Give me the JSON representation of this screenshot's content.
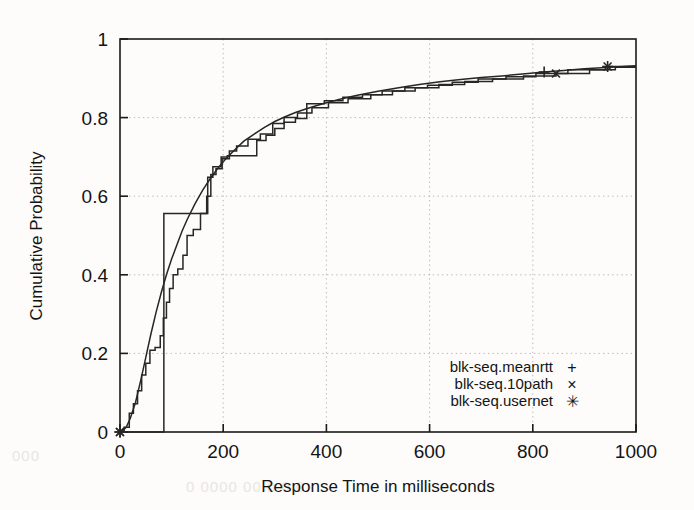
{
  "chart_data": {
    "type": "line",
    "title": "",
    "subtitle": "",
    "xlabel": "Response Time in milliseconds",
    "ylabel": "Cumulative Probability",
    "xlim": [
      0,
      1000
    ],
    "ylim": [
      0,
      1
    ],
    "xticks": [
      "0",
      "200",
      "400",
      "600",
      "800",
      "1000"
    ],
    "xtick_values": [
      0,
      200,
      400,
      600,
      800,
      1000
    ],
    "yticks": [
      "0",
      "0.2",
      "0.4",
      "0.6",
      "0.8",
      "1"
    ],
    "ytick_values": [
      0,
      0.2,
      0.4,
      0.6,
      0.8,
      1
    ],
    "grid": true,
    "grid_style": "dotted",
    "legend_position": "bottom-right",
    "line_color": "#262626",
    "grid_color": "#b9b9b9",
    "axis_color": "#1a1a1a",
    "background": "#fdfcfa",
    "series": [
      {
        "name": "blk-seq.meanrtt",
        "marker": "+",
        "marker_points": [
          [
            0,
            0
          ],
          [
            822,
            0.916
          ]
        ],
        "step": false,
        "points": [
          [
            0,
            0.0
          ],
          [
            5,
            0.003
          ],
          [
            12,
            0.012
          ],
          [
            20,
            0.035
          ],
          [
            30,
            0.075
          ],
          [
            40,
            0.13
          ],
          [
            50,
            0.19
          ],
          [
            60,
            0.25
          ],
          [
            70,
            0.305
          ],
          [
            80,
            0.355
          ],
          [
            90,
            0.4
          ],
          [
            100,
            0.44
          ],
          [
            110,
            0.475
          ],
          [
            120,
            0.51
          ],
          [
            130,
            0.54
          ],
          [
            145,
            0.58
          ],
          [
            160,
            0.615
          ],
          [
            175,
            0.645
          ],
          [
            190,
            0.672
          ],
          [
            205,
            0.695
          ],
          [
            220,
            0.715
          ],
          [
            240,
            0.74
          ],
          [
            260,
            0.758
          ],
          [
            280,
            0.775
          ],
          [
            300,
            0.79
          ],
          [
            320,
            0.802
          ],
          [
            340,
            0.813
          ],
          [
            360,
            0.822
          ],
          [
            380,
            0.83
          ],
          [
            400,
            0.838
          ],
          [
            430,
            0.848
          ],
          [
            460,
            0.857
          ],
          [
            500,
            0.867
          ],
          [
            540,
            0.876
          ],
          [
            580,
            0.884
          ],
          [
            620,
            0.891
          ],
          [
            660,
            0.897
          ],
          [
            700,
            0.902
          ],
          [
            740,
            0.906
          ],
          [
            780,
            0.911
          ],
          [
            822,
            0.916
          ],
          [
            860,
            0.92
          ],
          [
            900,
            0.924
          ],
          [
            950,
            0.928
          ],
          [
            1000,
            0.932
          ]
        ]
      },
      {
        "name": "blk-seq.10path",
        "marker": "×",
        "marker_points": [
          [
            0,
            0
          ],
          [
            845,
            0.912
          ]
        ],
        "step": true,
        "points": [
          [
            0,
            0.0
          ],
          [
            8,
            0.0
          ],
          [
            8,
            0.012
          ],
          [
            18,
            0.012
          ],
          [
            18,
            0.048
          ],
          [
            26,
            0.048
          ],
          [
            26,
            0.072
          ],
          [
            34,
            0.072
          ],
          [
            34,
            0.105
          ],
          [
            42,
            0.105
          ],
          [
            42,
            0.145
          ],
          [
            50,
            0.145
          ],
          [
            50,
            0.175
          ],
          [
            58,
            0.175
          ],
          [
            58,
            0.208
          ],
          [
            68,
            0.208
          ],
          [
            68,
            0.215
          ],
          [
            78,
            0.215
          ],
          [
            78,
            0.245
          ],
          [
            84,
            0.245
          ],
          [
            84,
            0.29
          ],
          [
            90,
            0.29
          ],
          [
            90,
            0.33
          ],
          [
            96,
            0.33
          ],
          [
            96,
            0.365
          ],
          [
            103,
            0.365
          ],
          [
            103,
            0.4
          ],
          [
            112,
            0.4
          ],
          [
            112,
            0.415
          ],
          [
            122,
            0.415
          ],
          [
            122,
            0.45
          ],
          [
            130,
            0.45
          ],
          [
            130,
            0.5
          ],
          [
            142,
            0.5
          ],
          [
            142,
            0.515
          ],
          [
            156,
            0.515
          ],
          [
            156,
            0.556
          ],
          [
            168,
            0.556
          ],
          [
            168,
            0.6
          ],
          [
            176,
            0.6
          ],
          [
            176,
            0.655
          ],
          [
            186,
            0.655
          ],
          [
            186,
            0.67
          ],
          [
            198,
            0.67
          ],
          [
            198,
            0.695
          ],
          [
            212,
            0.695
          ],
          [
            212,
            0.715
          ],
          [
            226,
            0.715
          ],
          [
            226,
            0.728
          ],
          [
            248,
            0.728
          ],
          [
            248,
            0.745
          ],
          [
            272,
            0.745
          ],
          [
            272,
            0.758
          ],
          [
            296,
            0.758
          ],
          [
            296,
            0.785
          ],
          [
            318,
            0.785
          ],
          [
            318,
            0.8
          ],
          [
            344,
            0.8
          ],
          [
            344,
            0.812
          ],
          [
            372,
            0.812
          ],
          [
            372,
            0.825
          ],
          [
            404,
            0.825
          ],
          [
            404,
            0.838
          ],
          [
            442,
            0.838
          ],
          [
            442,
            0.848
          ],
          [
            486,
            0.848
          ],
          [
            486,
            0.858
          ],
          [
            528,
            0.858
          ],
          [
            528,
            0.868
          ],
          [
            572,
            0.868
          ],
          [
            572,
            0.876
          ],
          [
            618,
            0.876
          ],
          [
            618,
            0.884
          ],
          [
            668,
            0.884
          ],
          [
            668,
            0.892
          ],
          [
            722,
            0.892
          ],
          [
            722,
            0.898
          ],
          [
            782,
            0.898
          ],
          [
            782,
            0.906
          ],
          [
            845,
            0.906
          ],
          [
            845,
            0.912
          ],
          [
            910,
            0.912
          ],
          [
            910,
            0.922
          ],
          [
            960,
            0.922
          ],
          [
            960,
            0.928
          ],
          [
            1000,
            0.928
          ]
        ]
      },
      {
        "name": "blk-seq.usernet",
        "marker": "✳",
        "marker_points": [
          [
            0,
            0
          ],
          [
            945,
            0.93
          ]
        ],
        "step": true,
        "points": [
          [
            0,
            0.0
          ],
          [
            85,
            0.0
          ],
          [
            85,
            0.556
          ],
          [
            170,
            0.556
          ],
          [
            170,
            0.648
          ],
          [
            180,
            0.648
          ],
          [
            180,
            0.675
          ],
          [
            196,
            0.675
          ],
          [
            196,
            0.7
          ],
          [
            208,
            0.7
          ],
          [
            208,
            0.703
          ],
          [
            265,
            0.703
          ],
          [
            265,
            0.742
          ],
          [
            283,
            0.742
          ],
          [
            283,
            0.755
          ],
          [
            300,
            0.755
          ],
          [
            300,
            0.772
          ],
          [
            318,
            0.772
          ],
          [
            318,
            0.788
          ],
          [
            340,
            0.788
          ],
          [
            340,
            0.798
          ],
          [
            362,
            0.798
          ],
          [
            362,
            0.835
          ],
          [
            396,
            0.835
          ],
          [
            396,
            0.843
          ],
          [
            432,
            0.843
          ],
          [
            432,
            0.852
          ],
          [
            470,
            0.852
          ],
          [
            470,
            0.858
          ],
          [
            508,
            0.858
          ],
          [
            508,
            0.868
          ],
          [
            552,
            0.868
          ],
          [
            552,
            0.876
          ],
          [
            596,
            0.876
          ],
          [
            596,
            0.882
          ],
          [
            644,
            0.882
          ],
          [
            644,
            0.89
          ],
          [
            694,
            0.89
          ],
          [
            694,
            0.898
          ],
          [
            748,
            0.898
          ],
          [
            748,
            0.904
          ],
          [
            806,
            0.904
          ],
          [
            806,
            0.912
          ],
          [
            868,
            0.912
          ],
          [
            868,
            0.922
          ],
          [
            945,
            0.922
          ],
          [
            945,
            0.93
          ],
          [
            1000,
            0.93
          ]
        ]
      }
    ],
    "legend": [
      {
        "label": "blk-seq.meanrtt",
        "marker": "+"
      },
      {
        "label": "blk-seq.10path",
        "marker": "×"
      },
      {
        "label": "blk-seq.usernet",
        "marker": "✳"
      }
    ]
  }
}
